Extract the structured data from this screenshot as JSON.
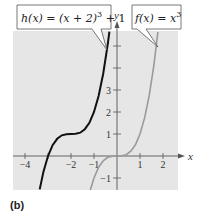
{
  "panel_label": "(b)",
  "callouts": {
    "h": {
      "name": "h",
      "lhs": "h(x) = (x + 2)",
      "exp": "3",
      "tail": " + 1"
    },
    "f": {
      "name": "f",
      "lhs": "f(x) = x",
      "exp": "3"
    }
  },
  "axes": {
    "x_label": "x",
    "y_label": "y",
    "x_ticks": [
      {
        "value": -4,
        "label": "−4"
      },
      {
        "value": -3,
        "label": ""
      },
      {
        "value": -2,
        "label": "−2"
      },
      {
        "value": -1,
        "label": "−1"
      },
      {
        "value": 1,
        "label": "1"
      },
      {
        "value": 2,
        "label": "2"
      }
    ],
    "y_ticks": [
      {
        "value": -1,
        "label": "−1"
      },
      {
        "value": 1,
        "label": "1"
      },
      {
        "value": 2,
        "label": "2"
      },
      {
        "value": 3,
        "label": "3"
      },
      {
        "value": 4,
        "label": ""
      },
      {
        "value": 5,
        "label": ""
      }
    ]
  },
  "colors": {
    "background": "#e6e6e6",
    "h_curve": "#111111",
    "f_curve": "#9a9a9a",
    "axis": "#555555"
  },
  "chart_data": {
    "type": "line",
    "title": "",
    "xlabel": "x",
    "ylabel": "y",
    "xlim": [
      -4.5,
      2.7
    ],
    "ylim": [
      -1.55,
      5.7
    ],
    "grid": false,
    "legend": "callout labels",
    "series": [
      {
        "name": "h(x) = (x + 2)^3 + 1",
        "color": "#111111",
        "x": [
          -3.36,
          -3.2,
          -3.0,
          -2.8,
          -2.6,
          -2.4,
          -2.2,
          -2.0,
          -1.8,
          -1.6,
          -1.4,
          -1.2,
          -1.0,
          -0.8,
          -0.6,
          -0.4,
          -0.33
        ],
        "y": [
          -1.52,
          -0.73,
          0.0,
          0.49,
          0.78,
          0.94,
          0.99,
          1.0,
          1.01,
          1.06,
          1.22,
          1.51,
          2.0,
          2.73,
          3.74,
          5.1,
          5.65
        ]
      },
      {
        "name": "f(x) = x^3",
        "color": "#9a9a9a",
        "x": [
          -1.16,
          -1.0,
          -0.8,
          -0.6,
          -0.4,
          -0.2,
          0.0,
          0.2,
          0.4,
          0.6,
          0.8,
          1.0,
          1.2,
          1.4,
          1.6,
          1.78
        ],
        "y": [
          -1.56,
          -1.0,
          -0.51,
          -0.22,
          -0.06,
          -0.01,
          0.0,
          0.01,
          0.06,
          0.22,
          0.51,
          1.0,
          1.73,
          2.74,
          4.1,
          5.64
        ]
      }
    ],
    "x_ticks": [
      -4,
      -3,
      -2,
      -1,
      1,
      2
    ],
    "x_tick_labels": [
      "−4",
      "",
      "−2",
      "−1",
      "1",
      "2"
    ],
    "y_ticks": [
      -1,
      1,
      2,
      3,
      4,
      5
    ],
    "y_tick_labels": [
      "−1",
      "1",
      "2",
      "3",
      "",
      ""
    ],
    "annotations": [
      "h(x) = (x + 2)^3 + 1",
      "f(x) = x^3",
      "(b)"
    ]
  }
}
